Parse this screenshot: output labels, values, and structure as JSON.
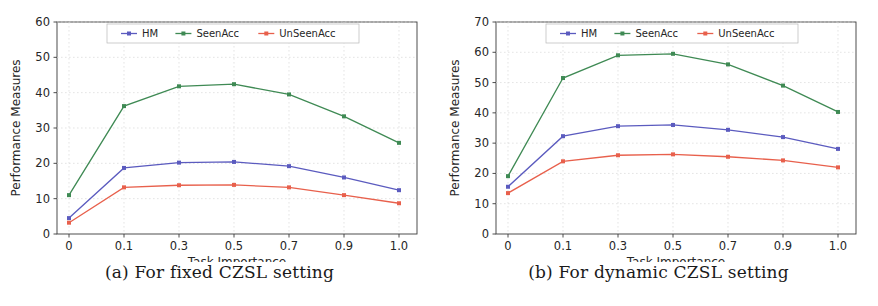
{
  "figure": {
    "background": "#ffffff",
    "series_colors": {
      "HM": "#5b5bbf",
      "SeenAcc": "#3f8a54",
      "UnSeenAcc": "#e8604c"
    },
    "axis_color": "#3a3a3a",
    "grid_color": "#d9d9d9"
  },
  "subfigures": [
    {
      "id": "a",
      "caption": "(a) For fixed CZSL setting",
      "chart_data": {
        "type": "line",
        "title": "",
        "xlabel": "Task Importance",
        "ylabel": "Performance Measures",
        "categories": [
          "0",
          "0.1",
          "0.3",
          "0.5",
          "0.7",
          "0.9",
          "1.0"
        ],
        "xtick_labels": [
          "0",
          "0.1",
          "0.3",
          "0.5",
          "0.7",
          "0.9",
          "1.0"
        ],
        "ytick_labels": [
          "0",
          "10",
          "20",
          "30",
          "40",
          "50",
          "60"
        ],
        "ylim": [
          0,
          60
        ],
        "yticks": [
          0,
          10,
          20,
          30,
          40,
          50,
          60
        ],
        "grid": true,
        "legend_position": "upper center",
        "series": [
          {
            "name": "HM",
            "color": "#5b5bbf",
            "marker": "square",
            "values": [
              4.5,
              18.7,
              20.2,
              20.4,
              19.2,
              16.0,
              12.4
            ]
          },
          {
            "name": "SeenAcc",
            "color": "#3f8a54",
            "marker": "square",
            "values": [
              11.0,
              36.2,
              41.8,
              42.4,
              39.5,
              33.3,
              25.8
            ]
          },
          {
            "name": "UnSeenAcc",
            "color": "#e8604c",
            "marker": "square",
            "values": [
              3.2,
              13.2,
              13.8,
              13.9,
              13.2,
              11.0,
              8.7
            ]
          }
        ]
      }
    },
    {
      "id": "b",
      "caption": "(b) For dynamic CZSL setting",
      "chart_data": {
        "type": "line",
        "title": "",
        "xlabel": "Task Importance",
        "ylabel": "Performance Measures",
        "categories": [
          "0",
          "0.1",
          "0.3",
          "0.5",
          "0.7",
          "0.9",
          "1.0"
        ],
        "xtick_labels": [
          "0",
          "0.1",
          "0.3",
          "0.5",
          "0.7",
          "0.9",
          "1.0"
        ],
        "ytick_labels": [
          "0",
          "10",
          "20",
          "30",
          "40",
          "50",
          "60",
          "70"
        ],
        "ylim": [
          0,
          70
        ],
        "yticks": [
          0,
          10,
          20,
          30,
          40,
          50,
          60,
          70
        ],
        "grid": true,
        "legend_position": "upper center",
        "series": [
          {
            "name": "HM",
            "color": "#5b5bbf",
            "marker": "square",
            "values": [
              15.6,
              32.3,
              35.6,
              36.0,
              34.4,
              32.0,
              28.1
            ]
          },
          {
            "name": "SeenAcc",
            "color": "#3f8a54",
            "marker": "square",
            "values": [
              19.1,
              51.5,
              59.0,
              59.5,
              56.0,
              49.0,
              40.3
            ]
          },
          {
            "name": "UnSeenAcc",
            "color": "#e8604c",
            "marker": "square",
            "values": [
              13.5,
              24.0,
              26.0,
              26.3,
              25.5,
              24.3,
              22.0
            ]
          }
        ]
      }
    }
  ]
}
